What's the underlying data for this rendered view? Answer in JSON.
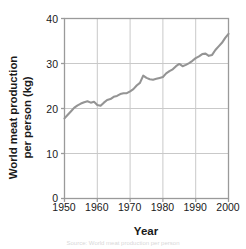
{
  "chart_data": {
    "type": "line",
    "title": "",
    "xlabel": "Year",
    "ylabel_line1": "World meat production",
    "ylabel_line2": "per person (kg)",
    "ylabel": "World meat production per person (kg)",
    "xlim": [
      1950,
      2000
    ],
    "ylim": [
      0,
      40
    ],
    "xticks": [
      "1950",
      "1960",
      "1970",
      "1980",
      "1990",
      "2000"
    ],
    "xtick_values": [
      1950,
      1960,
      1970,
      1980,
      1990,
      2000
    ],
    "yticks": [
      "0",
      "10",
      "20",
      "30",
      "40"
    ],
    "ytick_values": [
      0,
      10,
      20,
      30,
      40
    ],
    "grid": true,
    "legend": "none",
    "line_color": "#949494",
    "axis_color": "#9a9a9a",
    "grid_color": "#c9c9c9",
    "text_color": "#1a1a1a",
    "series": [
      {
        "name": "World meat production per person",
        "x": [
          1950,
          1951,
          1952,
          1953,
          1954,
          1955,
          1956,
          1957,
          1958,
          1959,
          1960,
          1961,
          1962,
          1963,
          1964,
          1965,
          1966,
          1967,
          1968,
          1969,
          1970,
          1971,
          1972,
          1973,
          1974,
          1975,
          1976,
          1977,
          1978,
          1979,
          1980,
          1981,
          1982,
          1983,
          1984,
          1985,
          1986,
          1987,
          1988,
          1989,
          1990,
          1991,
          1992,
          1993,
          1994,
          1995,
          1996,
          1997,
          1998,
          1999,
          2000
        ],
        "values": [
          17.8,
          18.6,
          19.4,
          20.2,
          20.7,
          21.1,
          21.4,
          21.6,
          21.3,
          21.5,
          20.8,
          20.6,
          21.3,
          21.9,
          22.1,
          22.6,
          22.8,
          23.2,
          23.4,
          23.4,
          23.8,
          24.3,
          25.1,
          25.7,
          27.3,
          26.8,
          26.5,
          26.4,
          26.6,
          26.8,
          27.0,
          27.8,
          28.3,
          28.7,
          29.4,
          29.9,
          29.4,
          29.7,
          30.1,
          30.6,
          31.2,
          31.6,
          32.1,
          32.2,
          31.7,
          31.9,
          33.0,
          33.8,
          34.6,
          35.7,
          36.6
        ]
      }
    ]
  },
  "footer": {
    "credit": "Source: World meat production per person"
  }
}
